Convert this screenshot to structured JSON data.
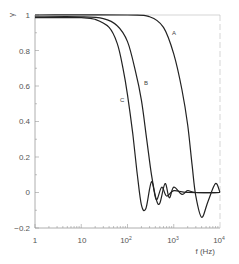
{
  "chart_data": {
    "type": "line",
    "title": "",
    "xlabel": "f (Hz)",
    "ylabel": "γ",
    "xscale": "log",
    "xlim": [
      1,
      10000
    ],
    "ylim": [
      -0.2,
      1
    ],
    "x_ticks": [
      "1",
      "10",
      "10²",
      "10³",
      "10⁴"
    ],
    "y_ticks": [
      "−0.2",
      "0",
      "0.2",
      "0.4",
      "0.6",
      "0.8",
      "1"
    ],
    "grid": false,
    "legend": "none (curves labeled inline)",
    "series": [
      {
        "name": "A",
        "x": [
          1,
          100,
          300,
          600,
          1000,
          1500,
          2000,
          2500,
          3000,
          4000,
          5500,
          8000,
          10000
        ],
        "values": [
          1.0,
          1.0,
          0.99,
          0.93,
          0.78,
          0.58,
          0.38,
          0.15,
          -0.02,
          -0.14,
          -0.05,
          0.05,
          0.0
        ]
      },
      {
        "name": "B",
        "x": [
          1,
          10,
          30,
          60,
          100,
          150,
          200,
          260,
          330,
          420,
          500,
          650,
          800,
          1000,
          1500,
          2000,
          3000,
          10000
        ],
        "values": [
          0.99,
          0.99,
          0.98,
          0.94,
          0.85,
          0.68,
          0.52,
          0.3,
          0.1,
          -0.04,
          -0.06,
          0.05,
          -0.03,
          0.03,
          -0.01,
          0.01,
          0.0,
          0.0
        ]
      },
      {
        "name": "C",
        "x": [
          1,
          10,
          20,
          40,
          60,
          80,
          100,
          130,
          160,
          200,
          250,
          330,
          420,
          550,
          700,
          1000,
          2000,
          10000
        ],
        "values": [
          0.985,
          0.985,
          0.975,
          0.93,
          0.84,
          0.7,
          0.55,
          0.33,
          0.12,
          -0.07,
          -0.09,
          0.06,
          -0.04,
          0.03,
          -0.02,
          0.01,
          0.0,
          0.0
        ]
      }
    ],
    "annotations": [
      {
        "text": "A",
        "near": "curve A at f≈1000, γ≈0.9"
      },
      {
        "text": "B",
        "near": "curve B at f≈250, γ≈0.45"
      },
      {
        "text": "C",
        "near": "curve C at f≈100, γ≈0.35"
      }
    ]
  },
  "labels": {
    "ylabel": "γ",
    "xlabel": "f (Hz)",
    "curve_a": "A",
    "curve_b": "B",
    "curve_c": "C",
    "x_tick_1": "1",
    "x_tick_10": "10",
    "x_tick_1e2_base": "10",
    "x_tick_1e2_exp": "2",
    "x_tick_1e3_base": "10",
    "x_tick_1e3_exp": "3",
    "x_tick_1e4_base": "10",
    "x_tick_1e4_exp": "4",
    "y_tick_m02": "−0.2",
    "y_tick_0": "0",
    "y_tick_02": "0.2",
    "y_tick_04": "0.4",
    "y_tick_06": "0.6",
    "y_tick_08": "0.8",
    "y_tick_1": "1"
  }
}
